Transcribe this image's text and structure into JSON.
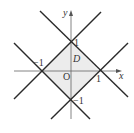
{
  "diagram": {
    "axes": {
      "x_label": "x",
      "y_label": "y",
      "origin_label": "O"
    },
    "region": {
      "label": "D",
      "fill": "#ececec"
    },
    "tick_labels": {
      "x_pos": "1",
      "x_neg": "−1",
      "y_pos": "1",
      "y_neg": "−1"
    },
    "lines": [
      {
        "name": "y = x + 1"
      },
      {
        "name": "y = -x + 1"
      },
      {
        "name": "y = x - 1"
      },
      {
        "name": "y = -x - 1"
      }
    ],
    "colors": {
      "line": "#2a2a2a",
      "axis": "#555555",
      "region": "#ececec"
    }
  }
}
